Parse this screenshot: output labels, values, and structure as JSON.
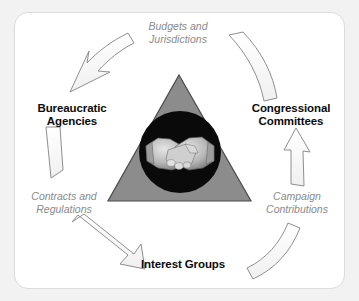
{
  "diagram": {
    "background_color": "#f2f2f2",
    "card_color": "#ffffff",
    "card_border_color": "#dcdcdc",
    "nodes": [
      {
        "id": "bureaucratic-agencies",
        "label_line1": "Bureaucratic",
        "label_line2": "Agencies",
        "text_color": "#0b0b0b"
      },
      {
        "id": "congressional-committees",
        "label_line1": "Congressional",
        "label_line2": "Committees",
        "text_color": "#0b0b0b"
      },
      {
        "id": "interest-groups",
        "label_line1": "Interest Groups",
        "label_line2": "",
        "text_color": "#0b0b0b"
      }
    ],
    "flows": [
      {
        "id": "budgets-and-jurisdictions",
        "label_line1": "Budgets and",
        "label_line2": "Jurisdictions",
        "from": "congressional-committees",
        "to": "bureaucratic-agencies",
        "text_color": "#8a8a8a"
      },
      {
        "id": "contracts-and-regulations",
        "label_line1": "Contracts and",
        "label_line2": "Regulations",
        "from": "bureaucratic-agencies",
        "to": "interest-groups",
        "text_color": "#8a8a8a"
      },
      {
        "id": "campaign-contributions",
        "label_line1": "Campaign",
        "label_line2": "Contributions",
        "from": "interest-groups",
        "to": "congressional-committees",
        "text_color": "#8a8a8a"
      }
    ],
    "center": {
      "shape": "triangle",
      "triangle_fill": "#8c8c8c",
      "triangle_stroke": "#3a3a3a",
      "circle_fill": "#0a0a0a",
      "emblem": "handshake-icon",
      "emblem_color": "#bfbfbf"
    },
    "arrow_style": {
      "fill": "#fbfbfb",
      "stroke": "#8f8f8f"
    }
  }
}
